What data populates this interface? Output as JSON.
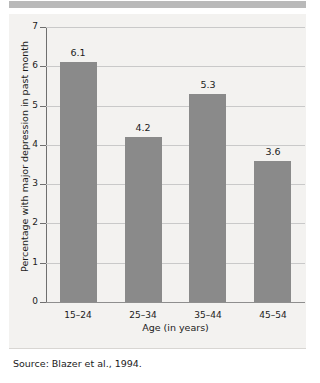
{
  "figure": {
    "background_color": "#ffffff",
    "panel_color": "#f3f2f0",
    "band_color": "#b9b9b9",
    "source_note": "Source: Blazer et al., 1994."
  },
  "chart_data": {
    "type": "bar",
    "title": "",
    "subtitle": "",
    "categories": [
      "15–24",
      "25–34",
      "35–44",
      "45–54"
    ],
    "values": [
      6.1,
      4.2,
      5.3,
      3.6
    ],
    "data_labels": [
      "6.1",
      "4.2",
      "5.3",
      "3.6"
    ],
    "xlabel": "Age (in years)",
    "ylabel": "Percentage with major depression in past month",
    "ylim": [
      0,
      7
    ],
    "ytick_labels": [
      "0",
      "1",
      "2",
      "3",
      "4",
      "5",
      "6",
      "7"
    ],
    "ytick_values": [
      0,
      1,
      2,
      3,
      4,
      5,
      6,
      7
    ],
    "grid": true,
    "grid_axis": "y",
    "legend": false,
    "legend_position": "none",
    "bar_color": "#8a8a8a",
    "gridline_color": "#c9c9c9",
    "axis_color": "#6f6f6f"
  }
}
